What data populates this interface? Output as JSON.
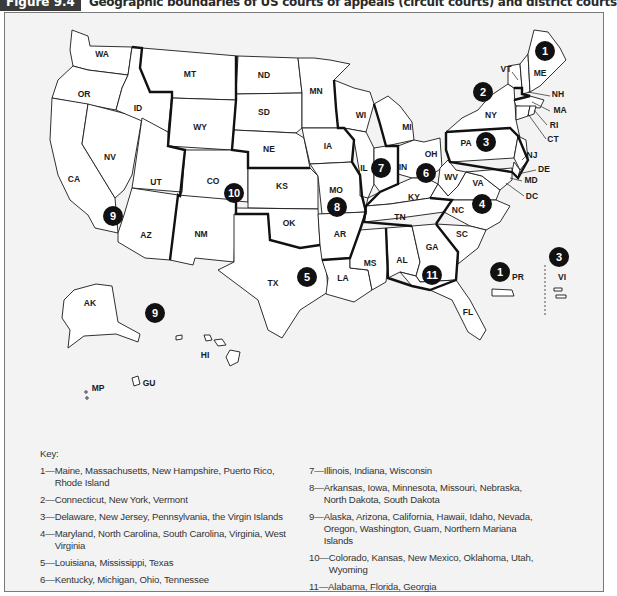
{
  "figure": {
    "label": "Figure 9.4",
    "title": "Geographic boundaries of US courts of appeals (circuit courts) and district courts"
  },
  "map": {
    "state_labels": [
      {
        "id": "WA",
        "x": 102,
        "y": 57
      },
      {
        "id": "OR",
        "x": 84,
        "y": 97
      },
      {
        "id": "CA",
        "x": 74,
        "y": 182
      },
      {
        "id": "NV",
        "x": 110,
        "y": 160
      },
      {
        "id": "ID",
        "x": 138,
        "y": 111
      },
      {
        "id": "MT",
        "x": 190,
        "y": 77
      },
      {
        "id": "WY",
        "x": 200,
        "y": 130
      },
      {
        "id": "UT",
        "x": 156,
        "y": 185
      },
      {
        "id": "CO",
        "x": 213,
        "y": 184
      },
      {
        "id": "AZ",
        "x": 146,
        "y": 238
      },
      {
        "id": "NM",
        "x": 201,
        "y": 237
      },
      {
        "id": "ND",
        "x": 264,
        "y": 78
      },
      {
        "id": "SD",
        "x": 264,
        "y": 115
      },
      {
        "id": "NE",
        "x": 269,
        "y": 152
      },
      {
        "id": "KS",
        "x": 282,
        "y": 189
      },
      {
        "id": "OK",
        "x": 289,
        "y": 226
      },
      {
        "id": "TX",
        "x": 273,
        "y": 286
      },
      {
        "id": "MN",
        "x": 316,
        "y": 94
      },
      {
        "id": "IA",
        "x": 328,
        "y": 149
      },
      {
        "id": "MO",
        "x": 336,
        "y": 193
      },
      {
        "id": "AR",
        "x": 340,
        "y": 237
      },
      {
        "id": "LA",
        "x": 343,
        "y": 281
      },
      {
        "id": "WI",
        "x": 361,
        "y": 118
      },
      {
        "id": "IL",
        "x": 364,
        "y": 171
      },
      {
        "id": "MS",
        "x": 370,
        "y": 266
      },
      {
        "id": "MI",
        "x": 407,
        "y": 130
      },
      {
        "id": "IN",
        "x": 403,
        "y": 170
      },
      {
        "id": "KY",
        "x": 414,
        "y": 200
      },
      {
        "id": "TN",
        "x": 400,
        "y": 220
      },
      {
        "id": "AL",
        "x": 402,
        "y": 263
      },
      {
        "id": "OH",
        "x": 431,
        "y": 157
      },
      {
        "id": "GA",
        "x": 432,
        "y": 250
      },
      {
        "id": "FL",
        "x": 468,
        "y": 315
      },
      {
        "id": "WV",
        "x": 451,
        "y": 180
      },
      {
        "id": "VA",
        "x": 478,
        "y": 186
      },
      {
        "id": "NC",
        "x": 458,
        "y": 213
      },
      {
        "id": "SC",
        "x": 462,
        "y": 237
      },
      {
        "id": "PA",
        "x": 466,
        "y": 146
      },
      {
        "id": "NY",
        "x": 491,
        "y": 118
      },
      {
        "id": "VT",
        "x": 506,
        "y": 72
      },
      {
        "id": "ME",
        "x": 540,
        "y": 76
      },
      {
        "id": "NH",
        "x": 558,
        "y": 97
      },
      {
        "id": "MA",
        "x": 560,
        "y": 113
      },
      {
        "id": "RI",
        "x": 554,
        "y": 128
      },
      {
        "id": "CT",
        "x": 553,
        "y": 142
      },
      {
        "id": "NJ",
        "x": 532,
        "y": 158
      },
      {
        "id": "DE",
        "x": 544,
        "y": 172
      },
      {
        "id": "MD",
        "x": 531,
        "y": 183
      },
      {
        "id": "DC",
        "x": 532,
        "y": 199
      },
      {
        "id": "PR",
        "x": 518,
        "y": 280
      },
      {
        "id": "VI",
        "x": 562,
        "y": 280
      },
      {
        "id": "AK",
        "x": 90,
        "y": 306
      },
      {
        "id": "HI",
        "x": 205,
        "y": 358
      },
      {
        "id": "GU",
        "x": 149,
        "y": 386
      },
      {
        "id": "MP",
        "x": 98,
        "y": 391
      }
    ],
    "circuit_markers": [
      {
        "num": "1",
        "x": 545,
        "y": 51
      },
      {
        "num": "2",
        "x": 483,
        "y": 92
      },
      {
        "num": "3",
        "x": 486,
        "y": 142
      },
      {
        "num": "4",
        "x": 482,
        "y": 204
      },
      {
        "num": "5",
        "x": 307,
        "y": 277
      },
      {
        "num": "6",
        "x": 426,
        "y": 173
      },
      {
        "num": "7",
        "x": 381,
        "y": 168
      },
      {
        "num": "8",
        "x": 337,
        "y": 207
      },
      {
        "num": "9",
        "x": 113,
        "y": 216
      },
      {
        "num": "9",
        "x": 155,
        "y": 313
      },
      {
        "num": "10",
        "x": 234,
        "y": 193
      },
      {
        "num": "11",
        "x": 432,
        "y": 275
      },
      {
        "num": "1",
        "x": 500,
        "y": 272
      },
      {
        "num": "3",
        "x": 559,
        "y": 257
      }
    ]
  },
  "key": {
    "title": "Key:",
    "left": [
      {
        "num": "1—",
        "text": "Maine, Massachusetts, New Hampshire, Puerto Rico, Rhode Island"
      },
      {
        "num": "2—",
        "text": "Connecticut, New York, Vermont"
      },
      {
        "num": "3—",
        "text": "Delaware, New Jersey, Pennsylvania, the Virgin Islands"
      },
      {
        "num": "4—",
        "text": "Maryland, North Carolina, South Carolina, Virginia, West Virginia"
      },
      {
        "num": "5—",
        "text": "Louisiana, Mississippi, Texas"
      },
      {
        "num": "6—",
        "text": "Kentucky, Michigan, Ohio, Tennessee"
      }
    ],
    "right": [
      {
        "num": "7—",
        "text": "Illinois, Indiana, Wisconsin"
      },
      {
        "num": "8—",
        "text": "Arkansas, Iowa, Minnesota, Missouri, Nebraska, North Dakota, South Dakota"
      },
      {
        "num": "9—",
        "text": "Alaska, Arizona, California, Hawaii, Idaho, Nevada, Oregon, Washington, Guam, Northern Mariana Islands"
      },
      {
        "num": "10—",
        "text": "Colorado, Kansas, New Mexico, Oklahoma, Utah, Wyoming"
      },
      {
        "num": "11—",
        "text": "Alabama, Florida, Georgia"
      }
    ]
  }
}
